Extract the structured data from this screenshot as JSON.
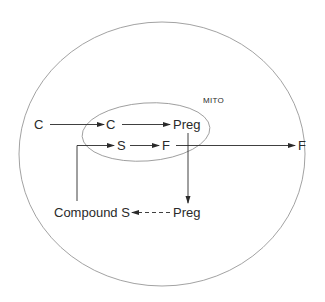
{
  "diagram": {
    "compartments": {
      "cell": {
        "label": ""
      },
      "mitochondrion": {
        "label": "MITO"
      }
    },
    "nodes": {
      "c_outside": "C",
      "c_mito": "C",
      "preg_mito": "Preg",
      "s_mito": "S",
      "f_mito": "F",
      "f_outside": "F",
      "compound_s": "Compound S",
      "preg_cyto": "Preg"
    },
    "edges": [
      {
        "from": "C (outside)",
        "to": "C (mito)",
        "style": "solid"
      },
      {
        "from": "C (mito)",
        "to": "Preg (mito)",
        "style": "solid"
      },
      {
        "from": "Preg (mito)",
        "to": "Preg (cytoplasm)",
        "style": "solid"
      },
      {
        "from": "Preg (cytoplasm)",
        "to": "Compound S",
        "style": "dashed"
      },
      {
        "from": "Compound S",
        "to": "S (mito)",
        "style": "solid"
      },
      {
        "from": "S (mito)",
        "to": "F (mito)",
        "style": "solid"
      },
      {
        "from": "F (mito)",
        "to": "F (outside)",
        "style": "solid"
      }
    ],
    "colors": {
      "stroke": "#2a2a2a",
      "outline": "#8a8a8a",
      "background": "#ffffff"
    }
  }
}
